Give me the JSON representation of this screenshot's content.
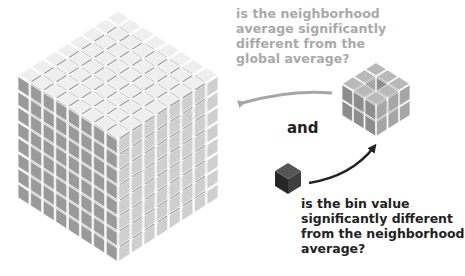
{
  "diagram": {
    "title": "",
    "global_cube": {
      "label": "global grid",
      "dims": [
        8,
        8,
        8
      ],
      "face_colors": {
        "top": "#efefef",
        "left": "#9a9a9a",
        "right": "#cfcfcf"
      }
    },
    "neighborhood_cube": {
      "label": "neighborhood",
      "dims": [
        3,
        3,
        2
      ],
      "missing": "center top",
      "face_colors": {
        "top": "#b9b9b9",
        "left": "#8d8d8d",
        "right": "#a6a6a6"
      }
    },
    "bin_cube": {
      "label": "bin",
      "face_colors": {
        "top": "#555555",
        "left": "#262626",
        "right": "#3e3e3e"
      }
    },
    "arrows": [
      {
        "from": "neighborhood",
        "to": "global",
        "color": "#a6a6a6"
      },
      {
        "from": "bin",
        "to": "neighborhood",
        "color": "#222222"
      }
    ],
    "question_global": "is the neighborhood\naverage significantly\ndifferent from the\nglobal average?",
    "connector": "and",
    "question_bin": "is the bin value\nsignificantly different\nfrom the neighborhood\naverage?"
  }
}
